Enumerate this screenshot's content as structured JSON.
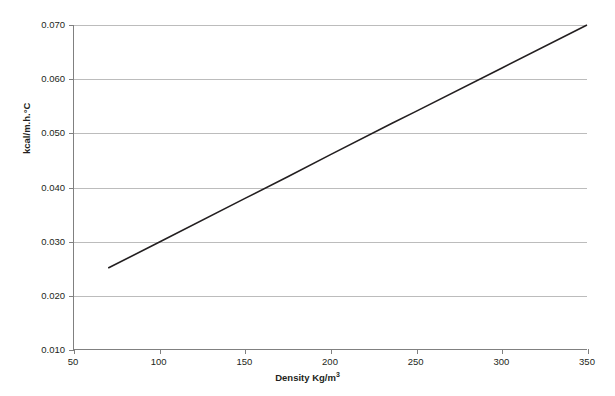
{
  "chart_data": {
    "type": "line",
    "title": "",
    "xlabel": "Density Kg/m³",
    "xlabel_base": "Density Kg/m",
    "xlabel_sup": "3",
    "ylabel": "kcal/m.h.°C",
    "xlim": [
      50,
      350
    ],
    "ylim": [
      0.01,
      0.07
    ],
    "xticks": [
      50,
      100,
      150,
      200,
      250,
      300,
      350
    ],
    "xtick_labels": [
      "50",
      "100",
      "150",
      "200",
      "250",
      "300",
      "350"
    ],
    "yticks": [
      0.01,
      0.02,
      0.03,
      0.04,
      0.05,
      0.06,
      0.07
    ],
    "ytick_labels": [
      "0.010",
      "0.020",
      "0.030",
      "0.040",
      "0.050",
      "0.060",
      "0.070"
    ],
    "grid": "horizontal",
    "legend": "none",
    "series": [
      {
        "name": "thermal-conductivity",
        "color": "#231f20",
        "line_width": 1.6,
        "x": [
          70,
          100,
          150,
          175,
          200,
          236,
          250,
          300,
          350
        ],
        "y": [
          0.025,
          0.0298,
          0.0379,
          0.0419,
          0.046,
          0.0518,
          0.054,
          0.062,
          0.07
        ],
        "points": [
          {
            "x": 70,
            "y": 0.025
          },
          {
            "x": 350,
            "y": 0.07
          }
        ]
      }
    ],
    "colors": {
      "line": "#231f20",
      "grid": "#bcbcbc",
      "axis": "#808080",
      "text": "#231f20",
      "background": "#ffffff"
    }
  }
}
